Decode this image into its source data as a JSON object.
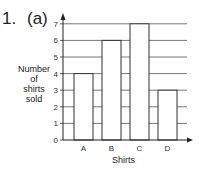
{
  "question": {
    "number": "1.",
    "part": "(a)"
  },
  "chart_data": {
    "type": "bar",
    "title": "",
    "categories": [
      "A",
      "B",
      "C",
      "D"
    ],
    "values": [
      4,
      6,
      7,
      3
    ],
    "xlabel": "Shirts",
    "ylabel": "Number of shirts sold",
    "ylim": [
      0,
      7
    ],
    "yticks": [
      0,
      1,
      2,
      3,
      4,
      5,
      6,
      7
    ],
    "grid": true,
    "legend": null
  },
  "labels": {
    "ylabel_lines": [
      "Number",
      "of",
      "shirts",
      "sold"
    ],
    "xlabel": "Shirts"
  }
}
